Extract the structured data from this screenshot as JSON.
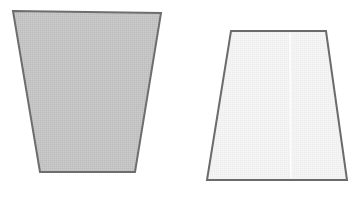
{
  "canvas": {
    "width": 352,
    "height": 198,
    "background_color": "#ffffff",
    "description": "Two outlined quadrilateral (trapezoid) shapes side by side on a white background"
  },
  "figures": [
    {
      "id": "left-trapezoid",
      "name": "inverted-trapezoid",
      "orientation": "wide-top-narrow-bottom",
      "fill_color": "#c4c4c4",
      "fill_texture": "dithered-halftone",
      "stroke_color": "#6e6e6e",
      "stroke_width": 2,
      "points": "13,11 161,13 135,172 40,172",
      "vertices": [
        {
          "label": "top-left",
          "x": 13,
          "y": 11
        },
        {
          "label": "top-right",
          "x": 161,
          "y": 13
        },
        {
          "label": "bottom-right",
          "x": 135,
          "y": 172
        },
        {
          "label": "bottom-left",
          "x": 40,
          "y": 172
        }
      ],
      "top_edge_length": 148,
      "bottom_edge_length": 95,
      "height": 160
    },
    {
      "id": "right-trapezoid",
      "name": "upright-trapezoid",
      "orientation": "narrow-top-wide-bottom",
      "fill_color": "#f2f2f2",
      "fill_texture": "fine-stipple",
      "stroke_color": "#6b6b6b",
      "stroke_width": 2,
      "points": "231,31 326,31 347,180 207,180",
      "vertices": [
        {
          "label": "top-left",
          "x": 231,
          "y": 31
        },
        {
          "label": "top-right",
          "x": 326,
          "y": 31
        },
        {
          "label": "bottom-right",
          "x": 347,
          "y": 180
        },
        {
          "label": "bottom-left",
          "x": 207,
          "y": 180
        }
      ],
      "top_edge_length": 95,
      "bottom_edge_length": 140,
      "height": 149,
      "seam": {
        "name": "vertical-seam",
        "color": "#fbfbfb",
        "x_top": 290,
        "y_top": 33,
        "x_bottom": 291,
        "y_bottom": 178,
        "width": 2
      }
    }
  ]
}
